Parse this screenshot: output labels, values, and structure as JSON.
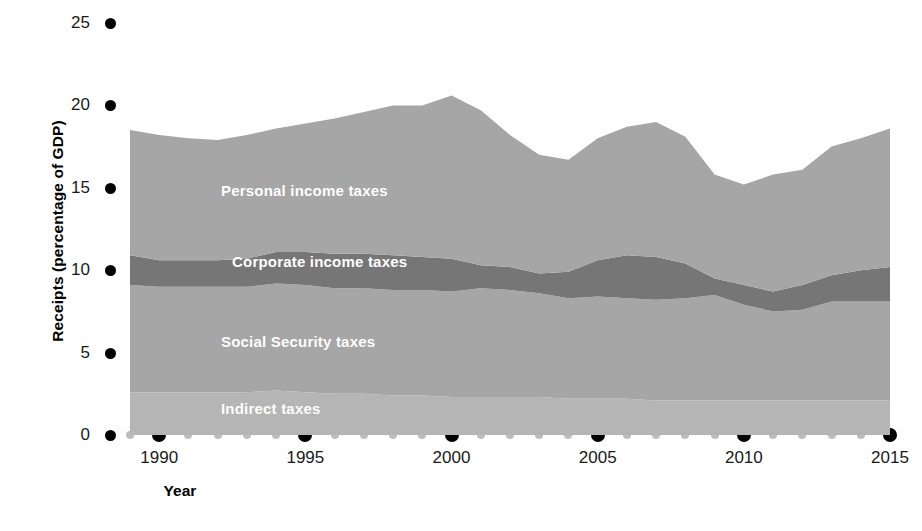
{
  "axes": {
    "ylabel": "Receipts (percentage of GDP)",
    "xlabel": "Year",
    "yticks": [
      "25",
      "20",
      "15",
      "10",
      "5",
      "0"
    ],
    "ytick_values": [
      25,
      20,
      15,
      10,
      5,
      0
    ],
    "xticks": [
      "1990",
      "1995",
      "2000",
      "2005",
      "2010",
      "2015"
    ],
    "xtick_values": [
      1990,
      1995,
      2000,
      2005,
      2010,
      2015
    ]
  },
  "series_labels": {
    "personal": "Personal income taxes",
    "corporate": "Corporate income taxes",
    "social": "Social Security taxes",
    "indirect": "Indirect taxes"
  },
  "colors": {
    "personal": "#a6a6a6",
    "corporate": "#767676",
    "social": "#a6a6a6",
    "indirect": "#b5b5b5",
    "axis_text": "#1a1a1a",
    "major_tick": "#000000",
    "minor_tick": "#bdbdbd",
    "label_text": "#ffffff",
    "background": "#ffffff"
  },
  "chart_data": {
    "type": "area",
    "title": "",
    "subtitle": "",
    "xlabel": "Year",
    "ylabel": "Receipts (percentage of GDP)",
    "xlim": [
      1989,
      2015
    ],
    "ylim": [
      0,
      25
    ],
    "grid": false,
    "legend": "inline-labels",
    "stacked": true,
    "x": [
      1989,
      1990,
      1991,
      1992,
      1993,
      1994,
      1995,
      1996,
      1997,
      1998,
      1999,
      2000,
      2001,
      2002,
      2003,
      2004,
      2005,
      2006,
      2007,
      2008,
      2009,
      2010,
      2011,
      2012,
      2013,
      2014,
      2015
    ],
    "series": [
      {
        "name": "Indirect taxes",
        "order": 1,
        "values": [
          2.6,
          2.6,
          2.6,
          2.6,
          2.6,
          2.7,
          2.6,
          2.5,
          2.5,
          2.4,
          2.4,
          2.3,
          2.3,
          2.3,
          2.3,
          2.2,
          2.2,
          2.2,
          2.1,
          2.1,
          2.1,
          2.1,
          2.1,
          2.1,
          2.1,
          2.1,
          2.1
        ]
      },
      {
        "name": "Social Security taxes",
        "order": 2,
        "values": [
          6.5,
          6.4,
          6.4,
          6.4,
          6.4,
          6.5,
          6.5,
          6.4,
          6.4,
          6.4,
          6.4,
          6.4,
          6.6,
          6.5,
          6.3,
          6.1,
          6.2,
          6.1,
          6.1,
          6.2,
          6.4,
          5.8,
          5.4,
          5.5,
          6.0,
          6.0,
          6.0
        ]
      },
      {
        "name": "Corporate income taxes",
        "order": 3,
        "values": [
          1.8,
          1.6,
          1.6,
          1.6,
          1.7,
          1.9,
          2.0,
          2.1,
          2.1,
          2.1,
          2.0,
          2.0,
          1.4,
          1.4,
          1.2,
          1.6,
          2.2,
          2.6,
          2.6,
          2.1,
          1.0,
          1.2,
          1.2,
          1.5,
          1.6,
          1.9,
          2.1
        ]
      },
      {
        "name": "Personal income taxes",
        "order": 4,
        "values": [
          7.6,
          7.6,
          7.4,
          7.3,
          7.5,
          7.5,
          7.8,
          8.2,
          8.6,
          9.1,
          9.2,
          9.9,
          9.4,
          8.0,
          7.2,
          6.8,
          7.4,
          7.8,
          8.2,
          7.7,
          6.3,
          6.1,
          7.1,
          7.0,
          7.8,
          8.0,
          8.4
        ]
      }
    ],
    "totals": [
      18.5,
      18.2,
      18.0,
      17.9,
      18.2,
      18.6,
      18.9,
      19.2,
      19.6,
      20.0,
      20.0,
      20.6,
      19.7,
      18.2,
      17.0,
      16.7,
      18.0,
      18.7,
      19.0,
      18.1,
      15.8,
      15.2,
      15.8,
      16.1,
      17.5,
      18.0,
      18.6
    ]
  },
  "footer_note": ""
}
